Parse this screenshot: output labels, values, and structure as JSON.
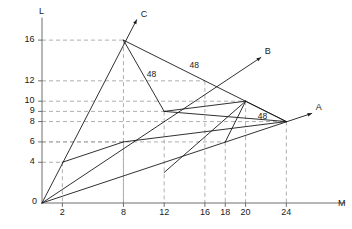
{
  "figure": {
    "axis_labels": {
      "y": "L",
      "x": "M"
    },
    "origin_label": "0",
    "colors": {
      "line": "#1a1a1a",
      "grid": "#9a9a9a",
      "axis": "#6f6f6f",
      "text": "#1a1a1a",
      "background": "#ffffff"
    }
  },
  "axes": {
    "x_ticks": [
      {
        "value": 2,
        "label": "2"
      },
      {
        "value": 8,
        "label": "8"
      },
      {
        "value": 12,
        "label": "12"
      },
      {
        "value": 16,
        "label": "16"
      },
      {
        "value": 18,
        "label": "18"
      },
      {
        "value": 20,
        "label": "20"
      },
      {
        "value": 24,
        "label": "24"
      }
    ],
    "y_ticks": [
      {
        "value": 4,
        "label": "4"
      },
      {
        "value": 6,
        "label": "6"
      },
      {
        "value": 8,
        "label": "8"
      },
      {
        "value": 9,
        "label": "9"
      },
      {
        "value": 10,
        "label": "10"
      },
      {
        "value": 12,
        "label": "12"
      },
      {
        "value": 16,
        "label": "16"
      }
    ],
    "x_range": [
      0,
      28
    ],
    "y_range": [
      0,
      18
    ]
  },
  "rays": [
    {
      "name": "A",
      "label": "A",
      "from": [
        0,
        0
      ],
      "to": [
        26.5,
        8.8
      ]
    },
    {
      "name": "B",
      "label": "B",
      "from": [
        0,
        0
      ],
      "to": [
        21.5,
        14.3
      ]
    },
    {
      "name": "C",
      "label": "C",
      "from": [
        0,
        0
      ],
      "to": [
        9.3,
        18.0
      ]
    }
  ],
  "isoquants": [
    {
      "label": "48",
      "label_pos": [
        14.5,
        14.0
      ],
      "points": [
        [
          8,
          16
        ],
        [
          24,
          8
        ]
      ]
    },
    {
      "label": "48",
      "label_pos": [
        10.3,
        13.2
      ],
      "points": [
        [
          8,
          16
        ],
        [
          12,
          9
        ]
      ]
    },
    {
      "label": "48",
      "label_pos": [
        21.2,
        9.0
      ],
      "points": [
        [
          20,
          10
        ],
        [
          24,
          8
        ]
      ]
    }
  ],
  "segments": [
    {
      "name": "seg-2-4-to-8-6",
      "points": [
        [
          2,
          4
        ],
        [
          8,
          6
        ]
      ]
    },
    {
      "name": "seg-8-6-to-24-8",
      "points": [
        [
          8,
          6
        ],
        [
          24,
          8
        ]
      ]
    },
    {
      "name": "seg-12-9-to-24-8",
      "points": [
        [
          12,
          9
        ],
        [
          24,
          8
        ]
      ]
    },
    {
      "name": "seg-12-3-to-20-10",
      "points": [
        [
          12,
          3
        ],
        [
          20,
          10
        ]
      ]
    },
    {
      "name": "seg-18-6-to-20-10",
      "points": [
        [
          18,
          6
        ],
        [
          20,
          10
        ]
      ]
    },
    {
      "name": "seg-12-9-to-20-10",
      "points": [
        [
          12,
          9
        ],
        [
          20,
          10
        ]
      ]
    }
  ],
  "grid_points": [
    {
      "coord": [
        8,
        16
      ]
    },
    {
      "coord": [
        16,
        12
      ]
    },
    {
      "coord": [
        20,
        10
      ]
    },
    {
      "coord": [
        12,
        9
      ]
    },
    {
      "coord": [
        24,
        8
      ]
    },
    {
      "coord": [
        8,
        6
      ]
    },
    {
      "coord": [
        18,
        6
      ]
    },
    {
      "coord": [
        2,
        4
      ]
    }
  ]
}
